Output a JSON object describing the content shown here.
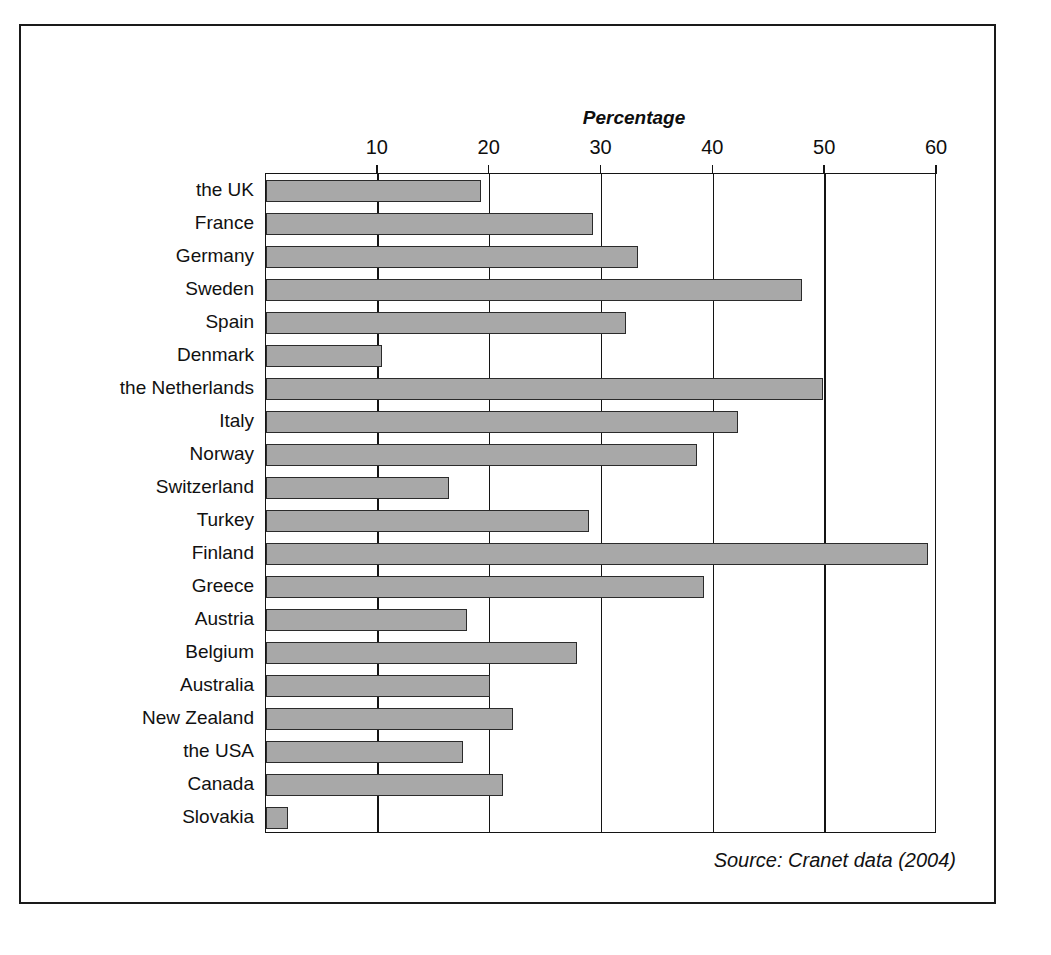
{
  "figure": {
    "source_note": "Source: Cranet data (2004)",
    "frame_color": "#1a1a1a",
    "shadow_color": "#0d0d0d",
    "bar_fill": "#a8a8a8",
    "bar_stroke": "#2b2b2b"
  },
  "chart_data": {
    "type": "bar",
    "orientation": "horizontal",
    "title": "",
    "xlabel": "Percentage",
    "ylabel": "",
    "xlim": [
      0,
      60
    ],
    "ylim": null,
    "grid": true,
    "legend": false,
    "legend_position": "none",
    "axis_title": "Percentage",
    "tick_labels": [
      "10",
      "20",
      "30",
      "40",
      "50",
      "60"
    ],
    "ticks": [
      10,
      20,
      30,
      40,
      50,
      60
    ],
    "categories": [
      "the UK",
      "France",
      "Germany",
      "Sweden",
      "Spain",
      "Denmark",
      "the Netherlands",
      "Italy",
      "Norway",
      "Switzerland",
      "Turkey",
      "Finland",
      "Greece",
      "Austria",
      "Belgium",
      "Australia",
      "New Zealand",
      "the USA",
      "Canada",
      "Slovakia"
    ],
    "values": [
      19.2,
      29.2,
      33.3,
      47.9,
      32.2,
      10.4,
      49.8,
      42.2,
      38.5,
      16.4,
      28.9,
      59.2,
      39.2,
      18.0,
      27.8,
      20.0,
      22.1,
      17.6,
      21.2,
      2.0
    ],
    "series": [
      {
        "name": "Percentage",
        "values": [
          19.2,
          29.2,
          33.3,
          47.9,
          32.2,
          10.4,
          49.8,
          42.2,
          38.5,
          16.4,
          28.9,
          59.2,
          39.2,
          18.0,
          27.8,
          20.0,
          22.1,
          17.6,
          21.2,
          2.0
        ]
      }
    ]
  }
}
